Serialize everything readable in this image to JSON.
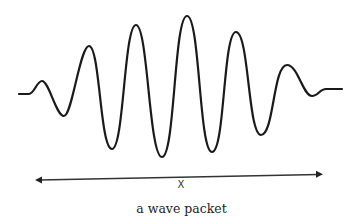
{
  "figure": {
    "caption": "a wave packet",
    "axis_label": "X",
    "colors": {
      "stroke": "#1a1a1a",
      "arrow": "#333333",
      "background": "#ffffff"
    },
    "wave": {
      "description": "Gaussian-enveloped oscillation (wave packet) with 6 peaks and 6 troughs",
      "peaks": 6,
      "troughs": 6
    },
    "arrow": {
      "type": "double-headed",
      "direction": "horizontal"
    }
  }
}
